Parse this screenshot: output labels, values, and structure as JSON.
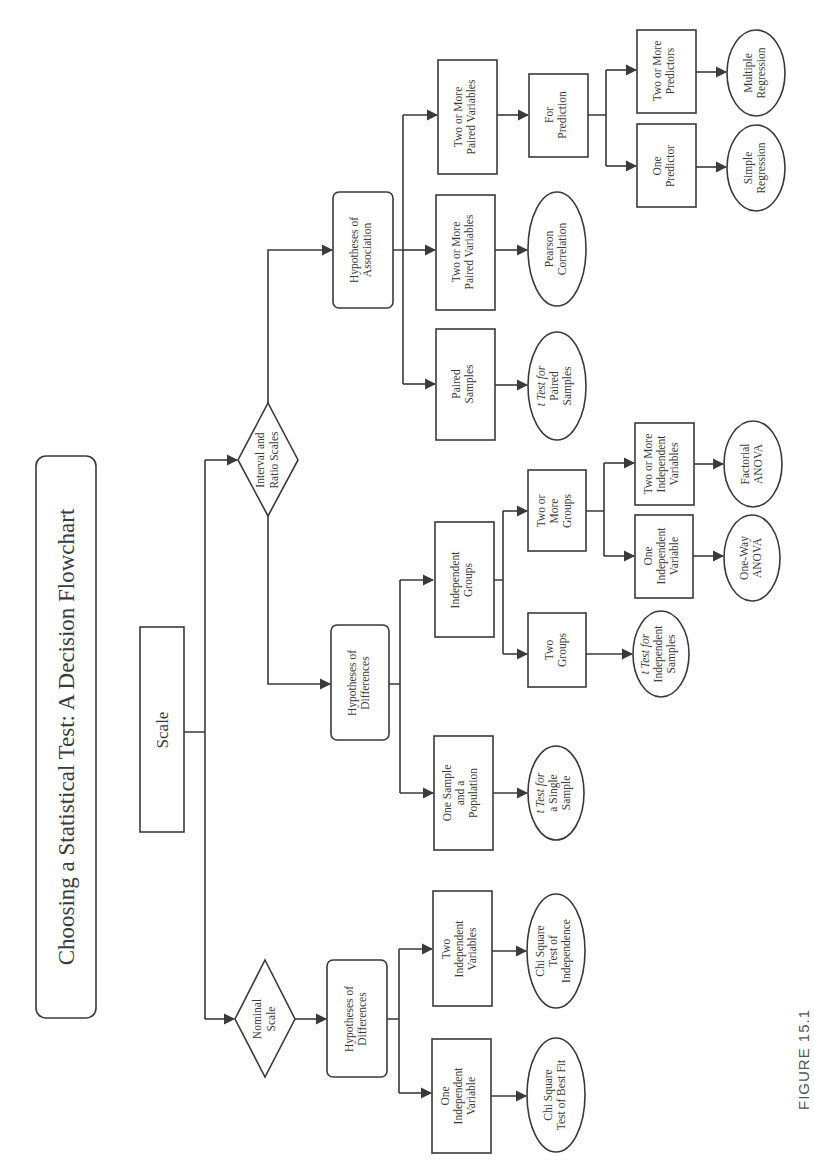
{
  "figure_label": "FIGURE 15.1",
  "title": "Choosing a Statistical Test: A Decision Flowchart",
  "colors": {
    "line": "#3a3a3a",
    "background": "#ffffff"
  },
  "nodes": {
    "scale": {
      "shape": "rect",
      "lines": [
        "Scale"
      ]
    },
    "nominal": {
      "shape": "diamond",
      "lines": [
        "Nominal",
        "Scale"
      ]
    },
    "interval": {
      "shape": "diamond",
      "lines": [
        "Interval and",
        "Ratio Scales"
      ]
    },
    "nom_hyp_diff": {
      "shape": "rounded",
      "lines": [
        "Hypotheses of",
        "Differences"
      ]
    },
    "nom_one_iv": {
      "shape": "rect",
      "lines": [
        "One",
        "Independent",
        "Variable"
      ]
    },
    "nom_two_iv": {
      "shape": "rect",
      "lines": [
        "Two",
        "Independent",
        "Variables"
      ]
    },
    "chi_best_fit": {
      "shape": "ellipse",
      "lines": [
        "Chi Square",
        "Test of Best Fit"
      ]
    },
    "chi_indep": {
      "shape": "ellipse",
      "lines": [
        "Chi Square",
        "Test of",
        "Independence"
      ]
    },
    "int_hyp_diff": {
      "shape": "rounded",
      "lines": [
        "Hypotheses of",
        "Differences"
      ]
    },
    "one_sample": {
      "shape": "rect",
      "lines": [
        "One Sample",
        "and a",
        "Population"
      ]
    },
    "t_single": {
      "shape": "ellipse",
      "lines": [
        "t Test for",
        "a Single",
        "Sample"
      ]
    },
    "indep_groups": {
      "shape": "rect",
      "lines": [
        "Independent",
        "Groups"
      ]
    },
    "two_groups": {
      "shape": "rect",
      "lines": [
        "Two",
        "Groups"
      ]
    },
    "t_indep": {
      "shape": "ellipse",
      "lines": [
        "t Test for",
        "Independent",
        "Samples"
      ]
    },
    "two_more_groups": {
      "shape": "rect",
      "lines": [
        "Two or",
        "More",
        "Groups"
      ]
    },
    "anova_one_iv": {
      "shape": "rect",
      "lines": [
        "One",
        "Independent",
        "Variable"
      ]
    },
    "oneway_anova": {
      "shape": "ellipse",
      "lines": [
        "One-Way",
        "ANOVA"
      ]
    },
    "anova_two_iv": {
      "shape": "rect",
      "lines": [
        "Two or More",
        "Independent",
        "Variables"
      ]
    },
    "factorial_anova": {
      "shape": "ellipse",
      "lines": [
        "Factorial",
        "ANOVA"
      ]
    },
    "hyp_assoc": {
      "shape": "rounded",
      "lines": [
        "Hypotheses of",
        "Association"
      ]
    },
    "paired_samples": {
      "shape": "rect",
      "lines": [
        "Paired",
        "Samples"
      ]
    },
    "t_paired": {
      "shape": "ellipse",
      "lines": [
        "t Test for",
        "Paired",
        "Samples"
      ]
    },
    "paired_vars_corr": {
      "shape": "rect",
      "lines": [
        "Two or More",
        "Paired Variables"
      ]
    },
    "pearson": {
      "shape": "ellipse",
      "lines": [
        "Pearson",
        "Correlation"
      ]
    },
    "paired_vars_pred": {
      "shape": "rect",
      "lines": [
        "Two or More",
        "Paired Variables"
      ]
    },
    "for_prediction": {
      "shape": "rect",
      "lines": [
        "For",
        "Prediction"
      ]
    },
    "one_predictor": {
      "shape": "rect",
      "lines": [
        "One",
        "Predictor"
      ]
    },
    "simple_regression": {
      "shape": "ellipse",
      "lines": [
        "Simple",
        "Regression"
      ]
    },
    "two_predictors": {
      "shape": "rect",
      "lines": [
        "Two or More",
        "Predictors"
      ]
    },
    "multiple_regression": {
      "shape": "ellipse",
      "lines": [
        "Multiple",
        "Regression"
      ]
    }
  }
}
